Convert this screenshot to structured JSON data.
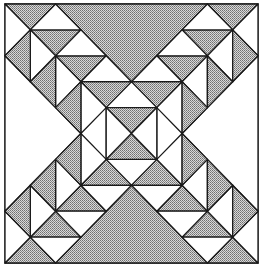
{
  "figure": {
    "grid_units": 10,
    "frame": {
      "x": 5,
      "y": 4,
      "width": 253,
      "height": 259
    },
    "colors": {
      "shaded": "#a8a8a8",
      "white": "#ffffff",
      "line": "#1a1a1a"
    },
    "regions": [
      {
        "name": "top-big-triangle",
        "fill": "shaded",
        "points": [
          [
            2,
            0
          ],
          [
            8,
            0
          ],
          [
            5,
            3
          ]
        ]
      },
      {
        "name": "bottom-big-triangle",
        "fill": "shaded",
        "points": [
          [
            2,
            10
          ],
          [
            8,
            10
          ],
          [
            5,
            7
          ]
        ]
      },
      {
        "name": "left-big-triangle",
        "fill": "white",
        "points": [
          [
            0,
            2
          ],
          [
            0,
            8
          ],
          [
            3,
            5
          ]
        ]
      },
      {
        "name": "right-big-triangle",
        "fill": "white",
        "points": [
          [
            10,
            2
          ],
          [
            10,
            8
          ],
          [
            7,
            5
          ]
        ]
      }
    ]
  }
}
